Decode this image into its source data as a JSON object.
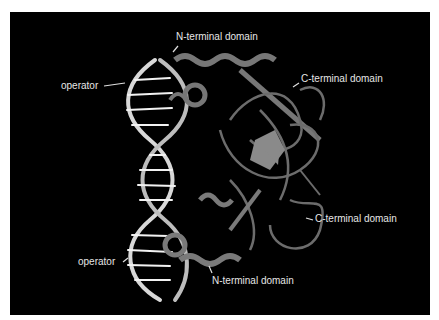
{
  "figure": {
    "background_color": "#000000",
    "labels": [
      {
        "id": "n-terminal-top",
        "text": "N-terminal domain"
      },
      {
        "id": "c-terminal-top",
        "text": "C-terminal domain"
      },
      {
        "id": "operator-top",
        "text": "operator"
      },
      {
        "id": "c-terminal-bottom",
        "text": "C-terminal domain"
      },
      {
        "id": "operator-bottom",
        "text": "operator"
      },
      {
        "id": "n-terminal-bottom",
        "text": "N-terminal domain"
      }
    ]
  }
}
